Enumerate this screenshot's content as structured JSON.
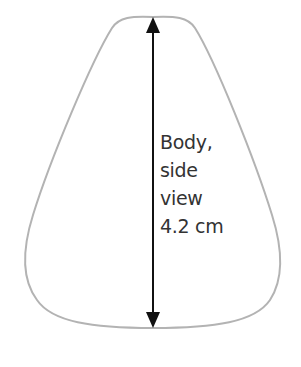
{
  "diagram": {
    "title": "Body, side view 4.2 cm",
    "label_lines": [
      "Body,",
      "side",
      "view",
      "4.2 cm"
    ],
    "measurement": {
      "value": "4.2",
      "unit": "cm",
      "dimension": "height"
    },
    "colors": {
      "outline": "#b3b3b3",
      "arrow": "#111111",
      "text": "#333333",
      "background": "#ffffff"
    }
  }
}
